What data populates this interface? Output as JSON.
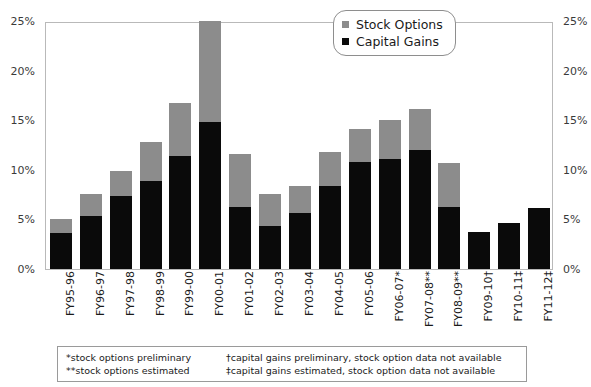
{
  "chart_data": {
    "type": "bar",
    "title": "",
    "subtitle": "",
    "xlabel": "",
    "ylabel": "",
    "stacked": true,
    "grid": false,
    "legend_position": "top-right",
    "ylim": [
      0,
      25
    ],
    "ytick_labels": [
      "0%",
      "5%",
      "10%",
      "15%",
      "20%",
      "25%"
    ],
    "ytick_values": [
      0,
      5,
      10,
      15,
      20,
      25
    ],
    "y_axis_duplicated_right": true,
    "categories": [
      "FY95-96",
      "FY96-97",
      "FY97-98",
      "FY98-99",
      "FY99-00",
      "FY00-01",
      "FY01-02",
      "FY02-03",
      "FY03-04",
      "FY04-05",
      "FY05-06",
      "FY06-07*",
      "FY07-08**",
      "FY08-09**",
      "FY09-10†",
      "FY10-11‡",
      "FY11-12‡"
    ],
    "series": [
      {
        "name": "Capital Gains",
        "color": "#0a0a0a",
        "values": [
          3.6,
          5.3,
          7.4,
          8.9,
          11.4,
          14.8,
          6.3,
          4.3,
          5.6,
          8.4,
          10.8,
          11.1,
          12.0,
          6.3,
          3.7,
          4.6,
          6.2
        ]
      },
      {
        "name": "Stock Options",
        "color": "#8c8c8c",
        "values": [
          1.4,
          2.3,
          2.5,
          3.9,
          5.3,
          10.2,
          5.3,
          3.3,
          2.8,
          3.4,
          3.3,
          3.9,
          4.1,
          4.4,
          0,
          0,
          0
        ]
      }
    ],
    "totals": [
      5.0,
      7.6,
      9.9,
      12.8,
      16.7,
      25.0,
      11.6,
      7.6,
      8.4,
      11.8,
      14.1,
      15.0,
      16.1,
      10.7,
      3.7,
      4.6,
      6.2
    ]
  },
  "legend": {
    "items": [
      {
        "label": "Stock Options",
        "color": "#8c8c8c"
      },
      {
        "label": "Capital Gains",
        "color": "#0a0a0a"
      }
    ]
  },
  "footnotes": {
    "rows": [
      {
        "left": "*stock options preliminary",
        "right": "†capital gains preliminary, stock option data not available"
      },
      {
        "left": "**stock options estimated",
        "right": "‡capital gains estimated, stock option data not available"
      }
    ]
  }
}
